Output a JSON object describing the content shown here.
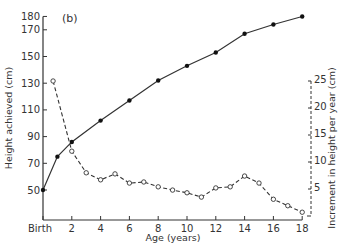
{
  "chart_data": {
    "type": "line",
    "panel_label": "(b)",
    "xlabel": "Age (years)",
    "ylabel": "Height achieved (cm)",
    "y2label": "Increment in height per year (cm)",
    "x_ticks": [
      {
        "value": 0,
        "label": "Birth"
      },
      {
        "value": 2,
        "label": "2"
      },
      {
        "value": 4,
        "label": "4"
      },
      {
        "value": 6,
        "label": "6"
      },
      {
        "value": 8,
        "label": "8"
      },
      {
        "value": 10,
        "label": "10"
      },
      {
        "value": 12,
        "label": "12"
      },
      {
        "value": 14,
        "label": "14"
      },
      {
        "value": 16,
        "label": "16"
      },
      {
        "value": 18,
        "label": "18"
      }
    ],
    "y_ticks": [
      50,
      70,
      90,
      110,
      130,
      150,
      170,
      180
    ],
    "y2_ticks": [
      5,
      10,
      15,
      20,
      25
    ],
    "xlim": [
      0,
      18
    ],
    "ylim": [
      27.5,
      180
    ],
    "y2lim": [
      0,
      25
    ],
    "grid": false,
    "legend": null,
    "series": [
      {
        "name": "Height achieved",
        "axis": "left",
        "style": "solid, filled markers",
        "x": [
          0,
          1,
          2,
          4,
          6,
          8,
          10,
          12,
          14,
          16,
          18
        ],
        "values": [
          50,
          75,
          86,
          102,
          117,
          132,
          143,
          153,
          167,
          174,
          180
        ]
      },
      {
        "name": "Increment in height per year",
        "axis": "right",
        "style": "dashed, open markers",
        "x": [
          0.7,
          2,
          3,
          4,
          5,
          6,
          7,
          8,
          9,
          10,
          11,
          12,
          13,
          14,
          15,
          16,
          17,
          18
        ],
        "values": [
          25,
          12,
          8,
          6.7,
          7.8,
          6.1,
          6.3,
          5.4,
          4.8,
          4.3,
          3.5,
          5.2,
          5.4,
          7.4,
          6.1,
          3.1,
          1.9,
          0.7
        ]
      }
    ]
  }
}
